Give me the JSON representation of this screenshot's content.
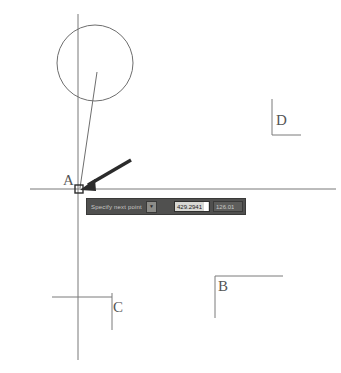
{
  "canvas": {
    "labels": [
      {
        "id": "A",
        "text": "A"
      },
      {
        "id": "B",
        "text": "B"
      },
      {
        "id": "C",
        "text": "C"
      },
      {
        "id": "D",
        "text": "D"
      }
    ]
  },
  "toolbar": {
    "command_label": "Specify next point",
    "dropdown_glyph": "▼",
    "x_value": "429.2941",
    "y_value": "126.01"
  }
}
